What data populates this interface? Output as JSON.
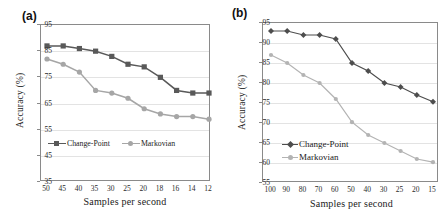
{
  "figure": {
    "panels": [
      {
        "id": "a",
        "label": "(a)",
        "chart_data": {
          "type": "line",
          "title": "",
          "xlabel": "Samples per second",
          "ylabel": "Accuracy (%)",
          "categories": [
            "50",
            "45",
            "40",
            "35",
            "30",
            "25",
            "20",
            "18",
            "16",
            "14",
            "12"
          ],
          "ylim": [
            35,
            95
          ],
          "yticks": [
            "95",
            "85",
            "75",
            "65",
            "55",
            "45",
            "35"
          ],
          "grid": true,
          "legend_position": "inside-bottom-left",
          "series": [
            {
              "name": "Change-Point",
              "color": "#595959",
              "marker": "square",
              "values": [
                87,
                87,
                86,
                85,
                83,
                80,
                79,
                75,
                70,
                69,
                69
              ]
            },
            {
              "name": "Markovian",
              "color": "#a6a6a6",
              "marker": "circle",
              "values": [
                82,
                80,
                77,
                70,
                69,
                67,
                63,
                61,
                60,
                60,
                59
              ]
            }
          ]
        }
      },
      {
        "id": "b",
        "label": "(b)",
        "chart_data": {
          "type": "line",
          "title": "",
          "xlabel": "Samples per second",
          "ylabel": "Accuracy (%)",
          "categories": [
            "100",
            "90",
            "80",
            "70",
            "60",
            "50",
            "40",
            "30",
            "25",
            "20",
            "15"
          ],
          "ylim": [
            55,
            95
          ],
          "yticks": [
            "95",
            "90",
            "85",
            "80",
            "75",
            "70",
            "65",
            "60",
            "55"
          ],
          "grid": true,
          "legend_position": "inside-bottom-left",
          "series": [
            {
              "name": "Change-Point",
              "color": "#4d4d4d",
              "marker": "diamond",
              "values": [
                93,
                93,
                92,
                92,
                91,
                85,
                83,
                80,
                79,
                77,
                75.3
              ]
            },
            {
              "name": "Markovian",
              "color": "#b3b3b3",
              "marker": "circle",
              "values": [
                87,
                85,
                82,
                80,
                76,
                70.2,
                67,
                65,
                63,
                61,
                60.2
              ]
            }
          ]
        }
      }
    ]
  }
}
